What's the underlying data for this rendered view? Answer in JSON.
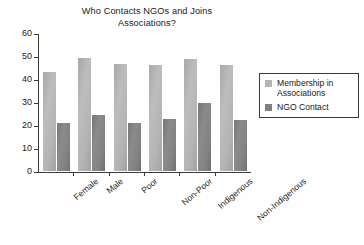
{
  "chart_data": {
    "type": "bar",
    "title": "Who Contacts NGOs and Joins Associations?",
    "title_line_1": "Who Contacts NGOs and Joins",
    "title_line_2": "Associations?",
    "xlabel": "",
    "ylabel": "",
    "ylim": [
      0,
      60
    ],
    "ytick_step": 10,
    "grid": false,
    "legend_position": "right",
    "categories": [
      "Female",
      "Male",
      "Poor",
      "Non-Poor",
      "Indigenous",
      "Non-Indigenous"
    ],
    "series": [
      {
        "name": "Membership in Associations",
        "color": "#b4b4b4",
        "values": [
          43,
          49,
          46.5,
          46,
          48.5,
          46
        ]
      },
      {
        "name": "NGO Contact",
        "color": "#808080",
        "values": [
          21,
          24.5,
          21,
          22.5,
          29.5,
          22
        ]
      }
    ],
    "yticks": [
      "60",
      "50",
      "40",
      "30",
      "20",
      "10",
      "0"
    ],
    "legend": [
      {
        "label_line_1": "Membership in",
        "label_line_2": "Associations",
        "color": "#b4b4b4"
      },
      {
        "label_line_1": "NGO Contact",
        "label_line_2": "",
        "color": "#808080"
      }
    ]
  }
}
